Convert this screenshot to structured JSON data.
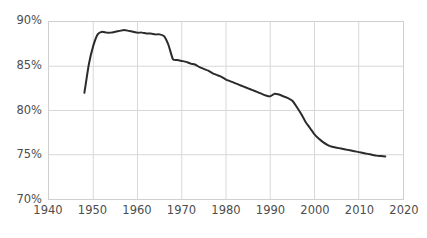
{
  "chart_data": {
    "type": "line",
    "title": "",
    "subtitle": "",
    "xlabel": "",
    "ylabel": "",
    "xlim": [
      1940,
      2020
    ],
    "ylim": [
      70,
      90
    ],
    "grid": true,
    "legend": null,
    "legend_position": "none",
    "x_ticks": [
      "1940",
      "1950",
      "1960",
      "1970",
      "1980",
      "1990",
      "2000",
      "2010",
      "2020"
    ],
    "y_ticks": [
      "70%",
      "75%",
      "80%",
      "85%",
      "90%"
    ],
    "y_tick_values": [
      70,
      75,
      80,
      85,
      90
    ],
    "x_tick_values": [
      1940,
      1950,
      1960,
      1970,
      1980,
      1990,
      2000,
      2010,
      2020
    ],
    "line_color": "#2b2b2b",
    "line_width": 2.0,
    "grid_color": "#d8d8d8",
    "axis_color": "#c9c9c9",
    "tick_label_color": "#4d4d4d",
    "background_color": "#ffffff",
    "series": [
      {
        "name": "series-1",
        "x": [
          1948,
          1949,
          1950,
          1951,
          1952,
          1953,
          1954,
          1955,
          1956,
          1957,
          1958,
          1959,
          1960,
          1961,
          1962,
          1963,
          1964,
          1965,
          1966,
          1967,
          1968,
          1969,
          1970,
          1971,
          1972,
          1973,
          1974,
          1975,
          1976,
          1977,
          1978,
          1979,
          1980,
          1981,
          1982,
          1983,
          1984,
          1985,
          1986,
          1987,
          1988,
          1989,
          1990,
          1991,
          1992,
          1993,
          1994,
          1995,
          1996,
          1997,
          1998,
          1999,
          2000,
          2001,
          2002,
          2003,
          2004,
          2005,
          2006,
          2007,
          2008,
          2009,
          2010,
          2011,
          2012,
          2013,
          2014,
          2015,
          2016
        ],
        "values": [
          82.0,
          85.2,
          87.3,
          88.6,
          88.9,
          88.8,
          88.8,
          88.9,
          89.0,
          89.1,
          89.0,
          88.9,
          88.8,
          88.8,
          88.7,
          88.7,
          88.6,
          88.6,
          88.4,
          87.4,
          85.8,
          85.7,
          85.6,
          85.5,
          85.3,
          85.2,
          84.9,
          84.7,
          84.5,
          84.2,
          84.0,
          83.8,
          83.5,
          83.3,
          83.1,
          82.9,
          82.7,
          82.5,
          82.3,
          82.1,
          81.9,
          81.7,
          81.6,
          81.9,
          81.8,
          81.6,
          81.4,
          81.1,
          80.4,
          79.6,
          78.7,
          78.0,
          77.3,
          76.8,
          76.4,
          76.1,
          75.9,
          75.8,
          75.7,
          75.6,
          75.5,
          75.4,
          75.3,
          75.2,
          75.1,
          75.0,
          74.9,
          74.85,
          74.8
        ]
      }
    ]
  }
}
